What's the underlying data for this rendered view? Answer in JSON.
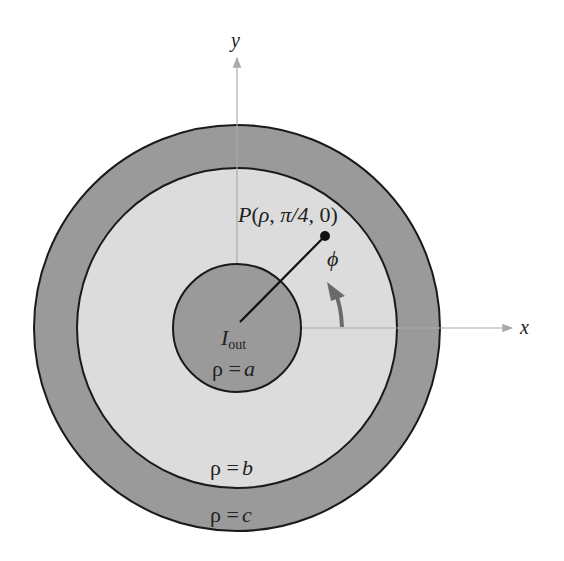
{
  "figure": {
    "colors": {
      "outer_conductor": "#9a9a9a",
      "dielectric": "#dcdcdc",
      "inner_conductor": "#9a9a9a",
      "outline": "#1a1a1a",
      "axis": "#aaaaaa",
      "phi_arrow": "#6a6a6a",
      "radius_line": "#111111"
    },
    "axes": {
      "x_label": "x",
      "y_label": "y"
    },
    "point": {
      "label_prefix": "P(",
      "rho": "ρ",
      "sep1": ", ",
      "phi_value": "π/4",
      "sep2": ", ",
      "z_value": "0",
      "label_suffix": ")",
      "angle_deg": 45
    },
    "angle_label": "ϕ",
    "current": {
      "symbol": "I",
      "subscript": "out"
    },
    "radii": {
      "a": {
        "rho": "ρ",
        "eq": " =",
        "name": "a"
      },
      "b": {
        "rho": "ρ",
        "eq": " =",
        "name": "b"
      },
      "c": {
        "rho": "ρ",
        "eq": " =",
        "name": "c"
      }
    }
  }
}
